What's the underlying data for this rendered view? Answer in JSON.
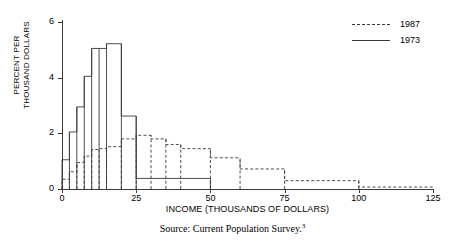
{
  "chart_data": {
    "type": "bar",
    "title": "",
    "xlabel": "INCOME (THOUSANDS OF DOLLARS)",
    "ylabel": "PERCENT PER\nTHOUSAND DOLLARS",
    "xlim": [
      0,
      125
    ],
    "ylim": [
      0,
      6
    ],
    "xticks": [
      0,
      25,
      50,
      75,
      100,
      125
    ],
    "yticks": [
      0,
      2,
      4,
      6
    ],
    "grid": false,
    "legend_position": "top-right",
    "series": [
      {
        "name": "1987",
        "style": "dashed",
        "color": "#3a3a3a",
        "bin_edges": [
          0,
          2.5,
          5,
          7.5,
          10,
          12.5,
          15,
          20,
          25,
          30,
          35,
          40,
          50,
          60,
          75,
          100,
          125
        ],
        "values": [
          0.35,
          0.62,
          0.95,
          1.18,
          1.42,
          1.45,
          1.52,
          1.8,
          1.93,
          1.8,
          1.6,
          1.45,
          1.12,
          0.72,
          0.3,
          0.07
        ]
      },
      {
        "name": "1973",
        "style": "solid",
        "color": "#3a3a3a",
        "bin_edges": [
          0,
          2.5,
          5,
          7.5,
          10,
          12.5,
          15,
          20,
          25,
          50
        ],
        "values": [
          1.05,
          2.05,
          2.95,
          4.05,
          5.05,
          5.05,
          5.22,
          2.62,
          0.38
        ]
      }
    ],
    "legend": [
      {
        "label": "1987",
        "style": "dashed"
      },
      {
        "label": "1973",
        "style": "solid"
      }
    ]
  },
  "footer": {
    "source_text": "Source: Current Population Survey.",
    "source_superscript": "3"
  },
  "axis": {
    "y_title_line1": "PERCENT PER",
    "y_title_line2": "THOUSAND DOLLARS",
    "x_title": "INCOME (THOUSANDS OF DOLLARS)"
  }
}
